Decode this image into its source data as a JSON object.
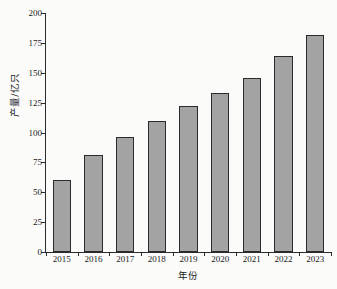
{
  "chart_data": {
    "type": "bar",
    "title": "",
    "xlabel": "年份",
    "ylabel": "产量/亿只",
    "categories": [
      "2015",
      "2016",
      "2017",
      "2018",
      "2019",
      "2020",
      "2021",
      "2022",
      "2023"
    ],
    "values": [
      60,
      81,
      96,
      110,
      122,
      133,
      146,
      164,
      182
    ],
    "series": [
      {
        "name": "产量",
        "values": [
          60,
          81,
          96,
          110,
          122,
          133,
          146,
          164,
          182
        ]
      }
    ],
    "ylim": [
      0,
      200
    ],
    "yticks": [
      0,
      25,
      50,
      75,
      100,
      125,
      150,
      175,
      200
    ],
    "ytick_labels": [
      "0",
      "25",
      "50",
      "75",
      "100",
      "125",
      "150",
      "175",
      "200"
    ],
    "xtick_labels": [
      "2015",
      "2016",
      "2017",
      "2018",
      "2019",
      "2020",
      "2021",
      "2022",
      "2023"
    ],
    "grid": false,
    "legend": null,
    "legend_position": "none",
    "bar_color": "#a3a3a3",
    "bar_edge_color": "#2b2b2b",
    "axis_color": "#2b2b2b",
    "background_color": "#fbfbfa"
  }
}
